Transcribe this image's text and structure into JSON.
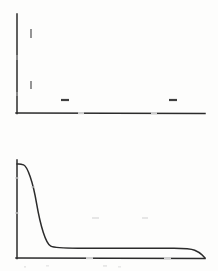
{
  "figure": {
    "name": "two-panel-scanned-plot",
    "background_color": "#fdfdfc",
    "ink_color": "#2b2b2b",
    "panel_count": 2
  },
  "chart_data": [
    {
      "type": "line",
      "name": "top-panel",
      "title": "",
      "subtitle": "",
      "xlabel": "",
      "ylabel": "",
      "xlim": [
        0,
        100
      ],
      "ylim": [
        0,
        100
      ],
      "grid": false,
      "legend": "none",
      "axes": {
        "y_axis_x_px": 17,
        "y_axis_top_px": 14,
        "y_axis_bottom_px": 113,
        "x_axis_y_px": 113,
        "x_axis_left_px": 17,
        "x_axis_right_px": 205
      },
      "x_ticks": [
        {
          "label": "",
          "x_px": 82
        },
        {
          "label": "",
          "x_px": 155
        }
      ],
      "y_ticks": [
        {
          "label": "",
          "y_px": 33
        },
        {
          "label": "",
          "y_px": 85
        }
      ],
      "annotations": [
        {
          "label": "",
          "kind": "dash-mark",
          "x_px": 65,
          "y_px": 100
        },
        {
          "label": "",
          "kind": "dash-mark",
          "x_px": 173,
          "y_px": 100
        }
      ],
      "series": [
        {
          "name": "",
          "x": [],
          "values": []
        }
      ],
      "note": "Top panel shows only axes with faint tick marks; no plotted data curve is visible."
    },
    {
      "type": "line",
      "name": "bottom-panel",
      "title": "",
      "subtitle": "",
      "xlabel": "",
      "ylabel": "",
      "xlim": [
        0,
        100
      ],
      "ylim": [
        0,
        100
      ],
      "grid": false,
      "legend": "none",
      "axes": {
        "y_axis_x_px": 17,
        "y_axis_top_px": 160,
        "y_axis_bottom_px": 258,
        "x_axis_y_px": 258,
        "x_axis_left_px": 17,
        "x_axis_right_px": 205
      },
      "x_ticks": [
        {
          "label": "",
          "x_px": 90
        },
        {
          "label": "",
          "x_px": 168
        }
      ],
      "y_ticks": [
        {
          "label": "",
          "y_px": 178
        },
        {
          "label": "",
          "y_px": 212
        }
      ],
      "annotations": [],
      "series": [
        {
          "name": "step-decay-curve",
          "x": [
            0,
            2,
            5,
            9,
            12,
            16,
            20,
            45,
            75,
            92,
            97,
            100
          ],
          "values": [
            96,
            96,
            94,
            72,
            38,
            14,
            10,
            10,
            10,
            10,
            6,
            0
          ],
          "description": "Curve begins near maximum at left, holds briefly, falls steeply to a low plateau, runs flat across the panel, then rounds down to the axis at the right edge."
        }
      ]
    }
  ]
}
